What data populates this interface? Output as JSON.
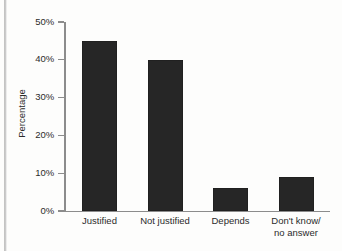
{
  "chart_data": {
    "type": "bar",
    "title": "",
    "xlabel": "",
    "ylabel": "Percentage",
    "categories": [
      "Justified",
      "Not justified",
      "Depends",
      "Don't know/\nno answer"
    ],
    "values": [
      45,
      40,
      6,
      9
    ],
    "ylim": [
      0,
      50
    ],
    "yticks": [
      0,
      10,
      20,
      30,
      40,
      50
    ],
    "ytick_labels": [
      "0%",
      "10%",
      "20%",
      "30%",
      "40%",
      "50%"
    ],
    "grid": false,
    "legend": null,
    "series": [
      {
        "name": "Percentage",
        "values": [
          45,
          40,
          6,
          9
        ]
      }
    ],
    "colors": {
      "bar": "#262626",
      "axis": "#8c8c8c",
      "text": "#2b2b2b",
      "background": "#fdfdfc"
    }
  }
}
